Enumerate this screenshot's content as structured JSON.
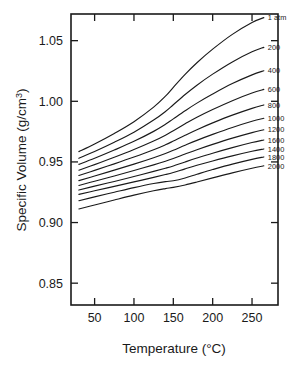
{
  "chart_data": {
    "type": "line",
    "title": "",
    "xlabel": "Temperature (°C)",
    "ylabel_full": "Specific Volume (g/cm3)",
    "ylabel_main": "Specific Volume (g/cm",
    "ylabel_exponent": "3",
    "ylabel_close": ")",
    "xlim": [
      20,
      283
    ],
    "ylim": [
      0.832,
      1.072
    ],
    "xticks": [
      50,
      100,
      150,
      200,
      250
    ],
    "xtick_labels": [
      "50",
      "100",
      "150",
      "200",
      "250"
    ],
    "yticks": [
      0.85,
      0.9,
      0.95,
      1.0,
      1.05
    ],
    "ytick_labels": [
      "0.85",
      "0.90",
      "0.95",
      "1.00",
      "1.05"
    ],
    "grid": false,
    "legend_position": "right-inline-end-of-curve",
    "series_label_note": "Labels are printed in the source figure in the order 1 atm, 200, 400, 600, 800, 1000, 1200, 1600, 1400, 1800, 2000",
    "x": [
      30,
      50,
      75,
      100,
      125,
      140,
      150,
      165,
      180,
      200,
      225,
      250,
      265
    ],
    "series": [
      {
        "name": "1 atm",
        "label": "1 atm",
        "pressure_atm": 1,
        "values": [
          0.9585,
          0.9648,
          0.9735,
          0.9832,
          0.9952,
          1.0042,
          1.0115,
          1.0222,
          1.0318,
          1.043,
          1.0552,
          1.065,
          1.069
        ]
      },
      {
        "name": "200",
        "label": "200",
        "pressure_atm": 200,
        "values": [
          0.953,
          0.9586,
          0.9662,
          0.9745,
          0.9845,
          0.9916,
          0.9972,
          1.0056,
          1.0133,
          1.0224,
          1.0325,
          1.0408,
          1.0445
        ]
      },
      {
        "name": "400",
        "label": "400",
        "pressure_atm": 400,
        "values": [
          0.948,
          0.953,
          0.9598,
          0.967,
          0.9752,
          0.981,
          0.9855,
          0.9922,
          0.9985,
          1.006,
          1.0146,
          1.0218,
          1.0252
        ]
      },
      {
        "name": "600",
        "label": "600",
        "pressure_atm": 600,
        "values": [
          0.9432,
          0.9478,
          0.9538,
          0.9602,
          0.9672,
          0.972,
          0.9758,
          0.9814,
          0.9868,
          0.9932,
          1.0005,
          1.0068,
          1.0098
        ]
      },
      {
        "name": "800",
        "label": "800",
        "pressure_atm": 800,
        "values": [
          0.9388,
          0.943,
          0.9484,
          0.954,
          0.96,
          0.9641,
          0.9672,
          0.972,
          0.9766,
          0.9822,
          0.9886,
          0.9942,
          0.997
        ]
      },
      {
        "name": "1000",
        "label": "1000",
        "pressure_atm": 1000,
        "values": [
          0.9346,
          0.9384,
          0.9432,
          0.9482,
          0.9535,
          0.957,
          0.9596,
          0.9638,
          0.9678,
          0.9727,
          0.9784,
          0.9835,
          0.986
        ]
      },
      {
        "name": "1200",
        "label": "1200",
        "pressure_atm": 1200,
        "values": [
          0.9306,
          0.9341,
          0.9384,
          0.9429,
          0.9476,
          0.9506,
          0.9528,
          0.9565,
          0.9601,
          0.9645,
          0.9696,
          0.9742,
          0.9765
        ]
      },
      {
        "name": "1400",
        "label": "1600",
        "pressure_atm": 1400,
        "values": [
          0.9268,
          0.93,
          0.9339,
          0.938,
          0.9422,
          0.9448,
          0.9467,
          0.95,
          0.9532,
          0.9572,
          0.9618,
          0.966,
          0.9681
        ]
      },
      {
        "name": "1600",
        "label": "1400",
        "pressure_atm": 1600,
        "values": [
          0.9232,
          0.9262,
          0.9298,
          0.9335,
          0.9373,
          0.9396,
          0.9413,
          0.9443,
          0.9472,
          0.9508,
          0.955,
          0.9588,
          0.9607
        ]
      },
      {
        "name": "1800",
        "label": "1800",
        "pressure_atm": 1800,
        "values": [
          0.918,
          0.9212,
          0.925,
          0.9288,
          0.9322,
          0.9338,
          0.9345,
          0.9368,
          0.9398,
          0.9437,
          0.9482,
          0.9521,
          0.9541
        ]
      },
      {
        "name": "2000",
        "label": "2000",
        "pressure_atm": 2000,
        "values": [
          0.9112,
          0.9145,
          0.9186,
          0.9226,
          0.9262,
          0.928,
          0.929,
          0.931,
          0.9334,
          0.9368,
          0.941,
          0.9448,
          0.9468
        ]
      }
    ]
  }
}
